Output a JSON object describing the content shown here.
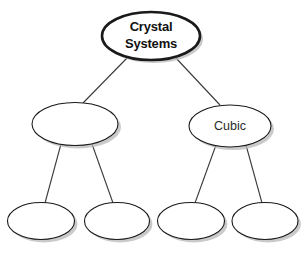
{
  "diagram": {
    "title": "Crystal Systems",
    "background_color": "#ffffff",
    "node_fill": "#ffffff",
    "node_stroke": "#1a1a1a",
    "connector_color": "#3a3a3a",
    "shadow_color": "#b4b4b4",
    "nodes": [
      {
        "id": "root",
        "label": "Crystal Systems",
        "label_lines": [
          "Crystal",
          "Systems"
        ],
        "level": 0,
        "cx": 151,
        "cy": 36,
        "rx": 49,
        "ry": 24,
        "stroke_width": 2.6,
        "bold": true,
        "empty": false
      },
      {
        "id": "branch-left",
        "label": "",
        "label_lines": [],
        "level": 1,
        "cx": 75,
        "cy": 124,
        "rx": 43,
        "ry": 21.5,
        "stroke_width": 1.1,
        "bold": false,
        "empty": true
      },
      {
        "id": "branch-right",
        "label": "Cubic",
        "label_lines": [
          "Cubic"
        ],
        "level": 1,
        "cx": 230,
        "cy": 126,
        "rx": 41,
        "ry": 21,
        "stroke_width": 1.1,
        "bold": false,
        "empty": false
      },
      {
        "id": "leaf-1",
        "label": "",
        "label_lines": [],
        "level": 2,
        "cx": 41,
        "cy": 221,
        "rx": 33.5,
        "ry": 18.5,
        "stroke_width": 1.1,
        "bold": false,
        "empty": true
      },
      {
        "id": "leaf-2",
        "label": "",
        "label_lines": [],
        "level": 2,
        "cx": 117,
        "cy": 221,
        "rx": 32.5,
        "ry": 18.5,
        "stroke_width": 1.1,
        "bold": false,
        "empty": true
      },
      {
        "id": "leaf-3",
        "label": "",
        "label_lines": [],
        "level": 2,
        "cx": 191,
        "cy": 221,
        "rx": 33.5,
        "ry": 18.5,
        "stroke_width": 1.1,
        "bold": false,
        "empty": true
      },
      {
        "id": "leaf-4",
        "label": "",
        "label_lines": [],
        "level": 2,
        "cx": 265,
        "cy": 221,
        "rx": 33,
        "ry": 18.5,
        "stroke_width": 1.1,
        "bold": false,
        "empty": true
      }
    ],
    "connectors": [
      {
        "id": "root-to-left",
        "from": "root",
        "to": "branch-left",
        "x1": 128,
        "y1": 57,
        "x2": 83,
        "y2": 103
      },
      {
        "id": "root-to-right",
        "from": "root",
        "to": "branch-right",
        "x1": 175,
        "y1": 57,
        "x2": 220,
        "y2": 105
      },
      {
        "id": "left-to-leaf1",
        "from": "branch-left",
        "to": "leaf-1",
        "x1": 61,
        "y1": 144,
        "x2": 45,
        "y2": 203
      },
      {
        "id": "left-to-leaf2",
        "from": "branch-left",
        "to": "leaf-2",
        "x1": 92,
        "y1": 144,
        "x2": 113,
        "y2": 203
      },
      {
        "id": "right-to-leaf3",
        "from": "branch-right",
        "to": "leaf-3",
        "x1": 216,
        "y1": 145,
        "x2": 195,
        "y2": 203
      },
      {
        "id": "right-to-leaf4",
        "from": "branch-right",
        "to": "leaf-4",
        "x1": 246,
        "y1": 145,
        "x2": 262,
        "y2": 203
      }
    ],
    "caption_stub": ""
  }
}
